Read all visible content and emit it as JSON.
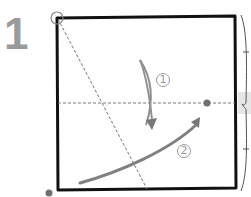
{
  "step": {
    "number": "1"
  },
  "labels": {
    "fold_1": "1",
    "fold_2": "2"
  },
  "colors": {
    "paper_edge": "#111111",
    "crease_line": "#777777",
    "arrow": "#808080",
    "dot": "#707070",
    "step_number": "#9a9a9a",
    "highlight": "#e6e6e6"
  },
  "icons": {
    "reference_circle": "circle-marker-icon",
    "dot_target": "dot-marker-icon",
    "dot_source": "dot-marker-icon",
    "arrow_1": "curved-fold-arrow-icon",
    "arrow_2": "curved-fold-arrow-icon",
    "brace": "right-brace-icon"
  }
}
